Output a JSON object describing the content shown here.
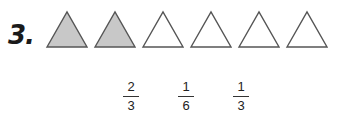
{
  "problem": {
    "number_label": "3.",
    "shapes": {
      "type": "triangle",
      "total": 6,
      "shaded": 2,
      "shaded_color": "#c8c8c8",
      "unshaded_color": "#ffffff",
      "stroke_color": "#555555"
    },
    "choices": [
      {
        "numerator": "2",
        "denominator": "3"
      },
      {
        "numerator": "1",
        "denominator": "6"
      },
      {
        "numerator": "1",
        "denominator": "3"
      }
    ]
  }
}
